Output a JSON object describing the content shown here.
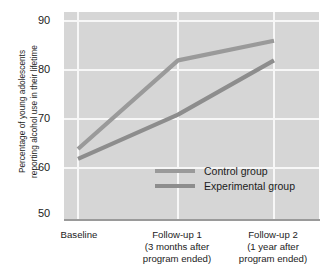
{
  "chart_data": {
    "type": "line",
    "title": "",
    "xlabel": "",
    "ylabel": "Percentage of young adolescents reporting alcohol use in their lifetime",
    "ylabel_lines": [
      "Percentage of young adolescents",
      "reporting alcohol use in their lifetime"
    ],
    "categories": [
      "Baseline",
      "Follow-up 1",
      "Follow-up 2"
    ],
    "category_labels": [
      [
        "Baseline"
      ],
      [
        "Follow-up 1",
        "(3 months after",
        "program ended)"
      ],
      [
        "Follow-up 2",
        "(1 year after",
        "program ended)"
      ]
    ],
    "series": [
      {
        "name": "Control group",
        "values": [
          64,
          82,
          86
        ],
        "color": "#9a9a9a"
      },
      {
        "name": "Experimental group",
        "values": [
          62,
          71,
          82
        ],
        "color": "#8d8d8d"
      }
    ],
    "ylim": [
      50,
      90
    ],
    "yticks": [
      90,
      80,
      70,
      60,
      50
    ],
    "ytick_labels": [
      "90",
      "80",
      "70",
      "60",
      "50"
    ],
    "grid": true,
    "legend_position": "center-right-inside",
    "plot_background": "#d6d6d6",
    "gridline_color": "#f7f7f7",
    "axis_color": "#9a9a9a"
  },
  "legend": {
    "entries": [
      {
        "label": "Control group"
      },
      {
        "label": "Experimental group"
      }
    ]
  }
}
